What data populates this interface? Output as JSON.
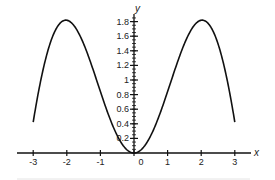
{
  "chart_data": {
    "type": "line",
    "title": "",
    "function": "y = x sin(x)",
    "xlabel": "x",
    "ylabel": "y",
    "xlim": [
      -3.5,
      3.6
    ],
    "ylim": [
      0,
      1.85
    ],
    "x_ticks": [
      -3,
      -2,
      -1,
      0,
      1,
      2,
      3
    ],
    "x_tick_labels": [
      "-3",
      "-2",
      "-1",
      "0",
      "1",
      "2",
      "3"
    ],
    "y_ticks": [
      0.2,
      0.4,
      0.6,
      0.8,
      1,
      1.2,
      1.4,
      1.6,
      1.8
    ],
    "y_tick_labels": [
      "0.2",
      "0.4",
      "0.6",
      "0.8",
      "1",
      "1.2",
      "1.4",
      "1.6",
      "1.8"
    ],
    "grid": false,
    "legend": null,
    "series": [
      {
        "name": "y = x sin x",
        "color": "#111111",
        "x": [
          -3,
          -2.5,
          -2,
          -1.5,
          -1,
          -0.5,
          0,
          0.5,
          1,
          1.5,
          2,
          2.5,
          3
        ],
        "y": [
          0.42,
          1.5,
          1.82,
          1.5,
          0.84,
          0.24,
          0,
          0.24,
          0.84,
          1.5,
          1.82,
          1.5,
          0.42
        ]
      }
    ]
  }
}
